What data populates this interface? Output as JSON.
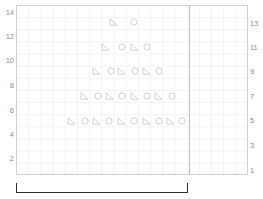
{
  "chart_data": {
    "type": "scatter",
    "title": "",
    "xlabel": "",
    "ylabel": "",
    "grid": true,
    "legend": false,
    "xlim": [
      0,
      19
    ],
    "ylim": [
      0,
      14.5
    ],
    "left_axis": {
      "name": "left-value-axis",
      "ticks": [
        "14",
        "12",
        "10",
        "8",
        "6",
        "4",
        "2"
      ],
      "tick_positions_px": [
        12,
        36,
        60,
        85,
        110,
        134,
        158
      ]
    },
    "right_axis": {
      "name": "right-value-axis",
      "ticks": [
        "13",
        "11",
        "9",
        "7",
        "5",
        "3",
        "1"
      ],
      "tick_positions_px": [
        23,
        47,
        71,
        96,
        120,
        145,
        170
      ]
    },
    "divider_x_px": 188,
    "marker_colors": {
      "triangle": "#c9c9c9",
      "circle": "#c9c9c9"
    },
    "rows": [
      {
        "row_label": "13",
        "y_px": 21,
        "count": 2,
        "markers": [
          "triangle",
          "circle"
        ],
        "x_px": [
          112,
          133
        ]
      },
      {
        "row_label": "11",
        "y_px": 46,
        "count": 4,
        "markers": [
          "triangle",
          "circle",
          "triangle",
          "circle"
        ],
        "x_px": [
          104,
          121,
          133,
          146
        ]
      },
      {
        "row_label": "9",
        "y_px": 70,
        "count": 6,
        "markers": [
          "triangle",
          "circle",
          "triangle",
          "circle",
          "triangle",
          "circle"
        ],
        "x_px": [
          95,
          110,
          120,
          134,
          145,
          158
        ]
      },
      {
        "row_label": "7",
        "y_px": 95,
        "count": 8,
        "markers": [
          "triangle",
          "circle",
          "triangle",
          "circle",
          "triangle",
          "circle",
          "triangle",
          "circle"
        ],
        "x_px": [
          83,
          97,
          108,
          121,
          133,
          146,
          157,
          171
        ]
      },
      {
        "row_label": "5",
        "y_px": 120,
        "count": 10,
        "markers": [
          "triangle",
          "circle",
          "triangle",
          "circle",
          "triangle",
          "circle",
          "triangle",
          "circle",
          "triangle",
          "circle"
        ],
        "x_px": [
          70,
          84,
          95,
          108,
          120,
          133,
          145,
          158,
          169,
          181
        ]
      }
    ]
  },
  "bracket": {
    "name": "range-bracket",
    "left_px": 16,
    "width_px": 172,
    "top_px": 183,
    "height_px": 10,
    "color": "#2b2b2b"
  }
}
